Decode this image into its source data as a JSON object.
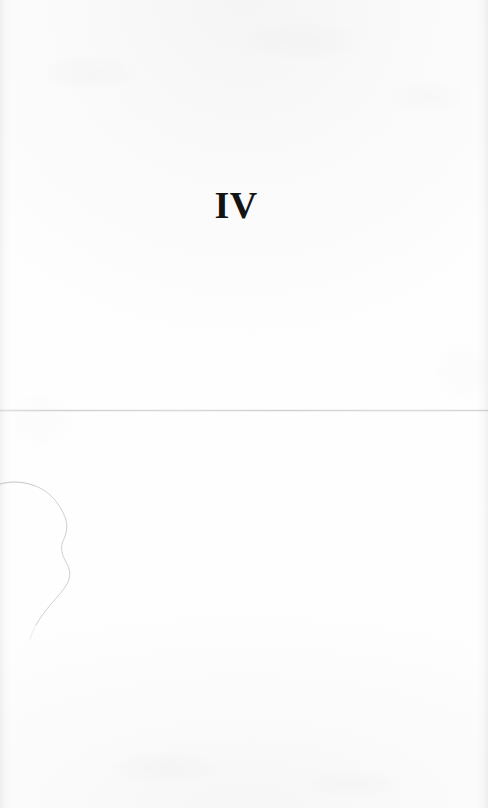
{
  "page": {
    "kind": "scanned-book-page",
    "page_type": "part-title-page",
    "background_color": "#fefefe",
    "ink_color": "#141414",
    "width": 488,
    "height": 808
  },
  "content": {
    "section_numeral": "IV",
    "numeral_style": "bold-serif-roman"
  },
  "artifacts": {
    "seam": {
      "name": "horizontal-scan-seam",
      "color": "#9ea0a4"
    },
    "crease": {
      "name": "page-crease-curve",
      "color": "#a8aaae"
    }
  }
}
